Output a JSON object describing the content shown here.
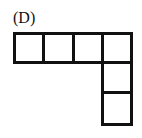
{
  "figure": {
    "label": "(D)",
    "line_color": "#111111",
    "cells": [
      {
        "row": 0,
        "col": 0
      },
      {
        "row": 0,
        "col": 1
      },
      {
        "row": 0,
        "col": 2
      },
      {
        "row": 0,
        "col": 3
      },
      {
        "row": 1,
        "col": 3
      },
      {
        "row": 2,
        "col": 3
      }
    ]
  }
}
